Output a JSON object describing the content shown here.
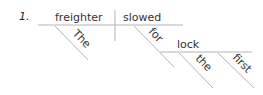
{
  "diagram": {
    "number": "1.",
    "type": "sentence-diagram",
    "sentence": "The freighter slowed for the first lock",
    "subject": {
      "word": "freighter",
      "modifiers": [
        "The"
      ]
    },
    "verb": {
      "word": "slowed"
    },
    "prepositional_phrase": {
      "preposition": "for",
      "object": {
        "word": "lock",
        "modifiers": [
          "the",
          "first"
        ]
      }
    },
    "line_color": "#b5b5b5",
    "text_color": "#333333"
  }
}
